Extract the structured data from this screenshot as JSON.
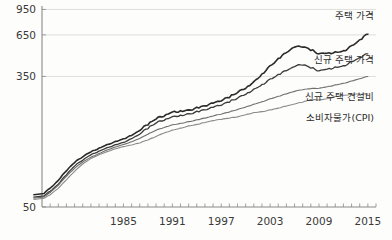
{
  "chart_data": {
    "type": "line",
    "title": "",
    "xlabel": "",
    "ylabel": "",
    "yscale": "log",
    "ylim": [
      50,
      1000
    ],
    "xlim": [
      1975,
      2016
    ],
    "grid": true,
    "legend_position": "inline-right",
    "ytick_labels": [
      "950",
      "650",
      "350",
      "50"
    ],
    "ytick_values": [
      950,
      650,
      350,
      50
    ],
    "xtick_labels": [
      "1985",
      "1991",
      "1997",
      "2003",
      "2009",
      "2015"
    ],
    "xtick_values": [
      1985,
      1991,
      1997,
      2003,
      2009,
      2015
    ],
    "x": [
      1975,
      1976,
      1977,
      1978,
      1979,
      1980,
      1981,
      1982,
      1983,
      1984,
      1985,
      1986,
      1987,
      1988,
      1989,
      1990,
      1991,
      1992,
      1993,
      1994,
      1995,
      1996,
      1997,
      1998,
      1999,
      2000,
      2001,
      2002,
      2003,
      2004,
      2005,
      2006,
      2007,
      2008,
      2009,
      2010,
      2011,
      2012,
      2013,
      2014,
      2015
    ],
    "series": [
      {
        "name": "주택 가격",
        "color": "#2b2b2b",
        "width": 1.6,
        "label_x": 2014,
        "label_y": 830,
        "values": [
          60,
          66,
          74,
          86,
          97,
          106,
          114,
          120,
          127,
          132,
          138,
          145,
          156,
          172,
          186,
          196,
          206,
          209,
          212,
          218,
          226,
          234,
          244,
          258,
          276,
          296,
          322,
          362,
          408,
          452,
          500,
          540,
          548,
          520,
          492,
          498,
          500,
          512,
          548,
          600,
          660
        ]
      },
      {
        "name": "신규 주택 가격",
        "color": "#3a3a3a",
        "width": 1.3,
        "label_x": 2014,
        "label_y": 430,
        "values": [
          58,
          63,
          70,
          81,
          92,
          101,
          109,
          115,
          121,
          126,
          131,
          138,
          148,
          162,
          175,
          184,
          192,
          196,
          200,
          206,
          213,
          220,
          229,
          240,
          254,
          270,
          288,
          310,
          334,
          358,
          382,
          404,
          420,
          398,
          382,
          392,
          400,
          410,
          432,
          462,
          492
        ]
      },
      {
        "name": "신규 주택 건설비",
        "color": "#6e6e6e",
        "width": 1.1,
        "label_x": 2014,
        "label_y": 248,
        "values": [
          57,
          62,
          69,
          79,
          89,
          98,
          105,
          111,
          117,
          122,
          127,
          132,
          139,
          148,
          157,
          164,
          170,
          174,
          178,
          183,
          188,
          194,
          200,
          206,
          214,
          222,
          231,
          240,
          250,
          260,
          270,
          280,
          288,
          292,
          294,
          300,
          308,
          316,
          326,
          338,
          350
        ]
      },
      {
        "name": "소비자물가(CPI)",
        "color": "#8a8a8a",
        "width": 1.1,
        "label_x": 2014,
        "label_y": 180,
        "values": [
          56,
          60,
          66,
          75,
          85,
          95,
          103,
          109,
          114,
          119,
          123,
          126,
          130,
          136,
          143,
          151,
          157,
          162,
          167,
          171,
          176,
          181,
          185,
          188,
          192,
          198,
          204,
          207,
          212,
          218,
          225,
          232,
          239,
          248,
          247,
          251,
          259,
          264,
          268,
          269,
          269
        ]
      }
    ]
  }
}
